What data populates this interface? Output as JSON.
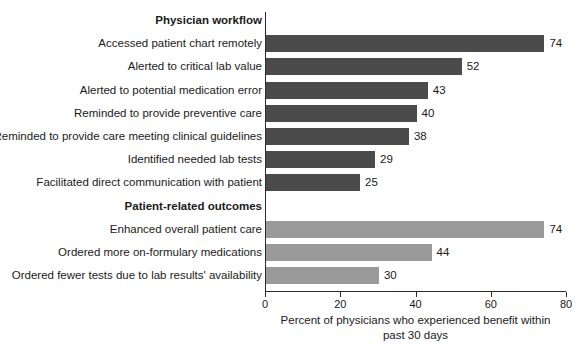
{
  "chart_data": {
    "type": "bar",
    "orientation": "horizontal",
    "title": "",
    "xlabel": "Percent of physicians who experienced benefit within past 30 days",
    "ylabel": "",
    "xlim": [
      0,
      80
    ],
    "xticks": [
      0,
      20,
      40,
      60,
      80
    ],
    "xtick_labels": [
      "0",
      "20",
      "40",
      "60",
      "80"
    ],
    "grid": false,
    "legend": "none",
    "colors": {
      "physician_workflow": "#4b4b4b",
      "patient_related_outcomes": "#9a9a9a",
      "axis": "#2b2b2b",
      "text": "#1a1a1a",
      "background": "#ffffff"
    },
    "groups": [
      {
        "name": "Physician workflow",
        "color": "#4b4b4b",
        "categories": [
          "Accessed patient chart remotely",
          "Alerted to critical lab value",
          "Alerted to potential medication error",
          "Reminded to provide preventive care",
          "Reminded to provide care meeting clinical guidelines",
          "Identified needed lab tests",
          "Facilitated direct communication with patient"
        ],
        "values": [
          74,
          52,
          43,
          40,
          38,
          29,
          25
        ]
      },
      {
        "name": "Patient-related outcomes",
        "color": "#9a9a9a",
        "categories": [
          "Enhanced overall patient care",
          "Ordered more on-formulary medications",
          "Ordered fewer tests due to lab results' availability"
        ],
        "values": [
          74,
          44,
          30
        ]
      }
    ],
    "categories": [
      "Accessed patient chart remotely",
      "Alerted to critical lab value",
      "Alerted to potential medication error",
      "Reminded to provide preventive care",
      "Reminded to provide care meeting clinical guidelines",
      "Identified needed lab tests",
      "Facilitated direct communication with patient",
      "Enhanced overall patient care",
      "Ordered more on-formulary medications",
      "Ordered fewer tests due to lab results' availability"
    ],
    "values": [
      74,
      52,
      43,
      40,
      38,
      29,
      25,
      74,
      44,
      30
    ]
  },
  "axis_title": {
    "line1": "Percent of physicians who experienced benefit within",
    "line2": "past 30 days"
  },
  "rows": [
    {
      "label": "Physician workflow",
      "kind": "header"
    },
    {
      "label": "Accessed patient chart remotely",
      "kind": "bar",
      "value": 74,
      "value_text": "74",
      "shade": "dark"
    },
    {
      "label": "Alerted to critical lab value",
      "kind": "bar",
      "value": 52,
      "value_text": "52",
      "shade": "dark"
    },
    {
      "label": "Alerted to potential medication error",
      "kind": "bar",
      "value": 43,
      "value_text": "43",
      "shade": "dark"
    },
    {
      "label": "Reminded to provide preventive care",
      "kind": "bar",
      "value": 40,
      "value_text": "40",
      "shade": "dark"
    },
    {
      "label": "Reminded to provide care meeting clinical guidelines",
      "kind": "bar",
      "value": 38,
      "value_text": "38",
      "shade": "dark"
    },
    {
      "label": "Identified needed lab tests",
      "kind": "bar",
      "value": 29,
      "value_text": "29",
      "shade": "dark"
    },
    {
      "label": "Facilitated direct communication with patient",
      "kind": "bar",
      "value": 25,
      "value_text": "25",
      "shade": "dark"
    },
    {
      "label": "Patient-related outcomes",
      "kind": "header"
    },
    {
      "label": "Enhanced overall patient care",
      "kind": "bar",
      "value": 74,
      "value_text": "74",
      "shade": "light"
    },
    {
      "label": "Ordered more on-formulary medications",
      "kind": "bar",
      "value": 44,
      "value_text": "44",
      "shade": "light"
    },
    {
      "label": "Ordered fewer tests due to lab results' availability",
      "kind": "bar",
      "value": 30,
      "value_text": "30",
      "shade": "light"
    }
  ],
  "ticks": [
    {
      "value": 0,
      "label": "0"
    },
    {
      "value": 20,
      "label": "20"
    },
    {
      "value": 40,
      "label": "40"
    },
    {
      "value": 60,
      "label": "60"
    },
    {
      "value": 80,
      "label": "80"
    }
  ]
}
